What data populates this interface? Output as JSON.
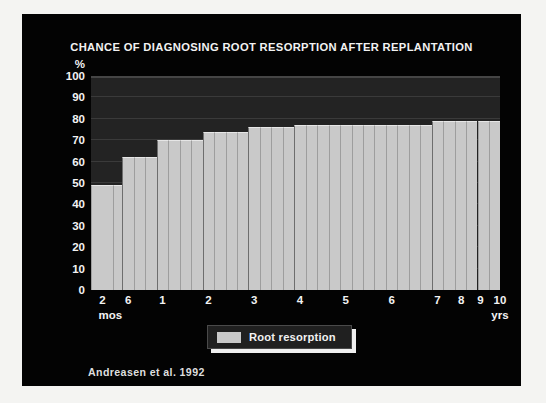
{
  "slide": {
    "background_color": "#030303",
    "frame_color": "#f4f4f2"
  },
  "title": "CHANCE OF DIAGNOSING ROOT RESORPTION AFTER REPLANTATION",
  "citation": "Andreasen et al. 1992",
  "legend": {
    "entries": [
      {
        "label": "Root resorption",
        "color": "#c9c9c9"
      }
    ]
  },
  "axes": {
    "y_unit": "%",
    "y_ticks": [
      "100",
      "90",
      "80",
      "70",
      "60",
      "50",
      "40",
      "30",
      "20",
      "10",
      "0"
    ],
    "x_unit_left": "mos",
    "x_unit_right": "yrs"
  },
  "chart_data": {
    "type": "bar",
    "title": "CHANCE OF DIAGNOSING ROOT RESORPTION AFTER REPLANTATION",
    "subtitle": "",
    "xlabel": "",
    "ylabel": "%",
    "ylim": [
      0,
      100
    ],
    "yticks": [
      0,
      10,
      20,
      30,
      40,
      50,
      60,
      70,
      80,
      90,
      100
    ],
    "grid": true,
    "legend_position": "bottom-center",
    "series_name": "Root resorption",
    "series_color": "#c9c9c9",
    "plot_background": "#232323",
    "note": "Cumulative stepped bar chart; each bar is one observation interval. Time axis is non-linear: first two ticks are months (2, 6), remaining ticks are years (1-10).",
    "categories": [
      "2 mos",
      "6 mos",
      "1 yr",
      "2 yrs",
      "3 yrs",
      "4 yrs",
      "5 yrs",
      "6 yrs",
      "7 yrs",
      "8 yrs",
      "9 yrs",
      "10 yrs"
    ],
    "values": [
      49,
      62,
      70,
      74,
      76,
      77,
      77,
      77,
      79,
      79,
      79,
      79
    ],
    "bars": [
      {
        "x_label": "2 mos",
        "value": 49,
        "x_pos": 0.0,
        "width": 0.055
      },
      {
        "x_label": "",
        "value": 49,
        "x_pos": 0.055,
        "width": 0.022
      },
      {
        "x_label": "6 mos",
        "value": 62,
        "x_pos": 0.077,
        "width": 0.028
      },
      {
        "x_label": "",
        "value": 62,
        "x_pos": 0.105,
        "width": 0.028
      },
      {
        "x_label": "",
        "value": 62,
        "x_pos": 0.133,
        "width": 0.028
      },
      {
        "x_label": "1 yr",
        "value": 70,
        "x_pos": 0.161,
        "width": 0.028
      },
      {
        "x_label": "",
        "value": 70,
        "x_pos": 0.189,
        "width": 0.028
      },
      {
        "x_label": "",
        "value": 70,
        "x_pos": 0.217,
        "width": 0.028
      },
      {
        "x_label": "",
        "value": 70,
        "x_pos": 0.245,
        "width": 0.028
      },
      {
        "x_label": "2 yrs",
        "value": 74,
        "x_pos": 0.273,
        "width": 0.028
      },
      {
        "x_label": "",
        "value": 74,
        "x_pos": 0.301,
        "width": 0.028
      },
      {
        "x_label": "",
        "value": 74,
        "x_pos": 0.329,
        "width": 0.028
      },
      {
        "x_label": "",
        "value": 74,
        "x_pos": 0.357,
        "width": 0.028
      },
      {
        "x_label": "3 yrs",
        "value": 76,
        "x_pos": 0.385,
        "width": 0.028
      },
      {
        "x_label": "",
        "value": 76,
        "x_pos": 0.413,
        "width": 0.028
      },
      {
        "x_label": "",
        "value": 76,
        "x_pos": 0.441,
        "width": 0.028
      },
      {
        "x_label": "",
        "value": 76,
        "x_pos": 0.469,
        "width": 0.028
      },
      {
        "x_label": "4 yrs",
        "value": 77,
        "x_pos": 0.497,
        "width": 0.028
      },
      {
        "x_label": "",
        "value": 77,
        "x_pos": 0.525,
        "width": 0.028
      },
      {
        "x_label": "",
        "value": 77,
        "x_pos": 0.553,
        "width": 0.028
      },
      {
        "x_label": "",
        "value": 77,
        "x_pos": 0.581,
        "width": 0.028
      },
      {
        "x_label": "5 yrs",
        "value": 77,
        "x_pos": 0.609,
        "width": 0.028
      },
      {
        "x_label": "",
        "value": 77,
        "x_pos": 0.637,
        "width": 0.028
      },
      {
        "x_label": "",
        "value": 77,
        "x_pos": 0.665,
        "width": 0.028
      },
      {
        "x_label": "",
        "value": 77,
        "x_pos": 0.693,
        "width": 0.028
      },
      {
        "x_label": "6 yrs",
        "value": 77,
        "x_pos": 0.721,
        "width": 0.028
      },
      {
        "x_label": "",
        "value": 77,
        "x_pos": 0.749,
        "width": 0.028
      },
      {
        "x_label": "",
        "value": 77,
        "x_pos": 0.777,
        "width": 0.028
      },
      {
        "x_label": "",
        "value": 77,
        "x_pos": 0.805,
        "width": 0.028
      },
      {
        "x_label": "7 yrs",
        "value": 79,
        "x_pos": 0.833,
        "width": 0.028
      },
      {
        "x_label": "",
        "value": 79,
        "x_pos": 0.861,
        "width": 0.028
      },
      {
        "x_label": "",
        "value": 79,
        "x_pos": 0.889,
        "width": 0.028
      },
      {
        "x_label": "8 yrs",
        "value": 79,
        "x_pos": 0.917,
        "width": 0.028
      },
      {
        "x_label": "",
        "value": 79,
        "x_pos": 0.945,
        "width": 0.028
      },
      {
        "x_label": "9 yrs",
        "value": 79,
        "x_pos": 0.973,
        "width": 0.027
      },
      {
        "x_label": "10 yrs",
        "value": 79,
        "x_pos": 1.0,
        "width": 0.0
      }
    ],
    "step_boundaries": [
      0.077,
      0.161,
      0.273,
      0.385,
      0.497,
      0.833
    ],
    "xtick_labels": [
      "2",
      "6",
      "1",
      "2",
      "3",
      "4",
      "5",
      "6",
      "7",
      "8",
      "9",
      "10"
    ],
    "xtick_positions": [
      0.028,
      0.091,
      0.175,
      0.287,
      0.399,
      0.511,
      0.623,
      0.735,
      0.847,
      0.905,
      0.952,
      1.0
    ]
  }
}
